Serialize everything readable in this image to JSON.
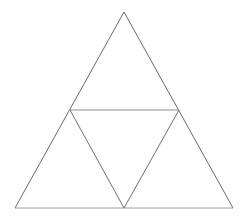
{
  "figure": {
    "background_color": "#ffffff",
    "width": 247,
    "height": 220
  },
  "style": {
    "outline_color": "#6a6a6a",
    "midline_color": "#8d8d8d",
    "base_color": "#a0a0a0",
    "inner_color": "#707070",
    "stroke_width": 1
  },
  "chart_data": {
    "type": "diagram",
    "subtype": "triangle-subdivision",
    "points": [
      {
        "id": "A",
        "name": "apex",
        "x": 124,
        "y": 12
      },
      {
        "id": "B",
        "name": "bottom-left",
        "x": 15,
        "y": 208
      },
      {
        "id": "C",
        "name": "bottom-right",
        "x": 233,
        "y": 208
      },
      {
        "id": "M_AB",
        "name": "left-midpoint",
        "x": 70,
        "y": 110
      },
      {
        "id": "M_AC",
        "name": "right-midpoint",
        "x": 179,
        "y": 110
      },
      {
        "id": "M_BC",
        "name": "bottom-midpoint",
        "x": 124,
        "y": 208
      }
    ],
    "segments": [
      {
        "id": "outer-left",
        "from": "A",
        "to": "B",
        "role": "outer-edge",
        "color": "#6a6a6a"
      },
      {
        "id": "outer-right",
        "from": "A",
        "to": "C",
        "role": "outer-edge",
        "color": "#6a6a6a"
      },
      {
        "id": "outer-base",
        "from": "B",
        "to": "C",
        "role": "outer-edge",
        "color": "#a0a0a0"
      },
      {
        "id": "midline-horizontal",
        "from": "M_AB",
        "to": "M_AC",
        "role": "midsegment",
        "color": "#8d8d8d"
      },
      {
        "id": "midline-left",
        "from": "M_AB",
        "to": "M_BC",
        "role": "midsegment",
        "color": "#707070"
      },
      {
        "id": "midline-right",
        "from": "M_AC",
        "to": "M_BC",
        "role": "midsegment",
        "color": "#707070"
      }
    ],
    "regions": [
      {
        "id": "top-triangle",
        "vertices": [
          "A",
          "M_AB",
          "M_AC"
        ],
        "orientation": "upright"
      },
      {
        "id": "bottom-left-triangle",
        "vertices": [
          "M_AB",
          "B",
          "M_BC"
        ],
        "orientation": "upright"
      },
      {
        "id": "bottom-right-triangle",
        "vertices": [
          "M_AC",
          "M_BC",
          "C"
        ],
        "orientation": "upright"
      },
      {
        "id": "center-triangle",
        "vertices": [
          "M_AB",
          "M_AC",
          "M_BC"
        ],
        "orientation": "inverted"
      }
    ],
    "region_count": 4,
    "labels": [],
    "annotations": []
  }
}
